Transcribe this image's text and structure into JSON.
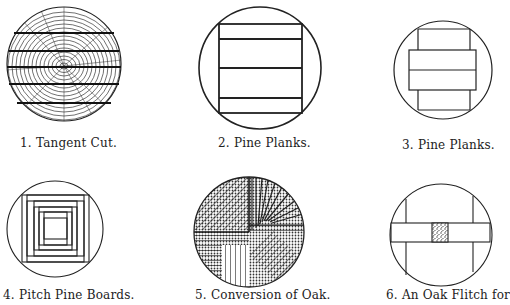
{
  "figures": [
    {
      "number": "1.",
      "caption": "Tangent Cut."
    },
    {
      "number": "2.",
      "caption": "Pine Planks."
    },
    {
      "number": "3.",
      "caption": "Pine Planks."
    },
    {
      "number": "4.",
      "caption": "Pitch Pine Boards."
    },
    {
      "number": "5.",
      "caption": "Conversion of Oak."
    },
    {
      "number": "6.",
      "caption": "An Oak Flitch for"
    }
  ],
  "colors": {
    "ink": "#222222",
    "paper": "#ffffff"
  }
}
